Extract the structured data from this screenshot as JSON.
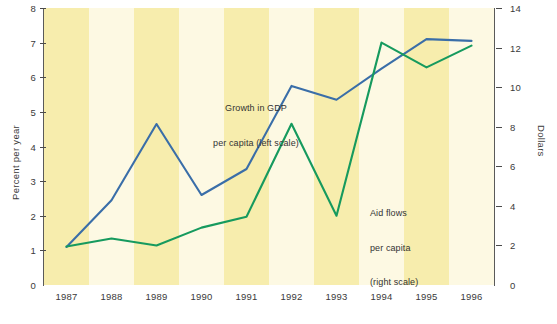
{
  "chart_data": {
    "type": "line",
    "title": "",
    "xlabel": "",
    "ylabel": "Percent per year",
    "y2label": "Dollars",
    "grid": false,
    "legend_position": "inline-annotations",
    "categories": [
      "1987",
      "1988",
      "1989",
      "1990",
      "1991",
      "1992",
      "1993",
      "1994",
      "1995",
      "1996"
    ],
    "ylim": [
      0,
      8
    ],
    "yticks": [
      0,
      1,
      2,
      3,
      4,
      5,
      6,
      7,
      8
    ],
    "y2lim": [
      0,
      14
    ],
    "y2ticks": [
      0,
      2,
      4,
      6,
      8,
      10,
      12,
      14
    ],
    "series": [
      {
        "name": "Growth in GDP per capita (left scale)",
        "axis": "left",
        "color": "#3a6ea8",
        "values": [
          1.1,
          2.45,
          4.65,
          2.6,
          3.35,
          5.75,
          5.35,
          6.25,
          7.1,
          7.05
        ]
      },
      {
        "name": "Aid flows per capita (right scale)",
        "axis": "right",
        "color": "#169a5e",
        "values": [
          1.95,
          2.35,
          2.0,
          2.9,
          3.45,
          8.15,
          3.5,
          12.25,
          11.0,
          12.1
        ]
      }
    ],
    "annotations": [
      {
        "id": "gdp",
        "text": "Growth in GDP\nper capita (left scale)"
      },
      {
        "id": "aid",
        "text": "Aid flows\nper capita\n(right scale)"
      }
    ],
    "bands": {
      "shaded_years": [
        "1987",
        "1989",
        "1991",
        "1993",
        "1995"
      ],
      "shaded_color": "#f7edad",
      "unshaded_color": "#fdf9e3"
    }
  },
  "axes": {
    "left": {
      "title": "Percent per year",
      "tick_labels": [
        "8",
        "7",
        "6",
        "5",
        "4",
        "3",
        "2",
        "1",
        "0"
      ]
    },
    "right": {
      "title": "Dollars",
      "tick_labels": [
        "14",
        "12",
        "10",
        "8",
        "6",
        "4",
        "2",
        "0"
      ]
    },
    "bottom": {
      "tick_labels": [
        "1987",
        "1988",
        "1989",
        "1990",
        "1991",
        "1992",
        "1993",
        "1994",
        "1995",
        "1996"
      ]
    }
  },
  "annotations": {
    "gdp_line1": "Growth in GDP",
    "gdp_line2": "per capita (left scale)",
    "aid_line1": "Aid flows",
    "aid_line2": "per capita",
    "aid_line3": "(right scale)"
  },
  "colors": {
    "gdp_line": "#3a6ea8",
    "aid_line": "#169a5e",
    "band_shaded": "#f7edad",
    "band_plain": "#fdf9e3",
    "axis": "#5a5a5a",
    "text": "#3a3a3a"
  }
}
